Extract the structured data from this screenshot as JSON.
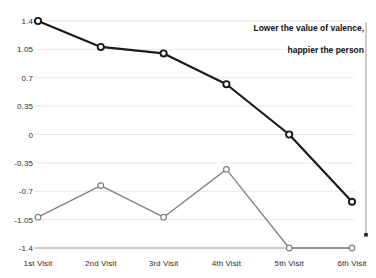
{
  "chart_data": {
    "type": "line",
    "title": "",
    "subtitle": "",
    "xlabel": "",
    "ylabel": "",
    "categories": [
      "1st Visit",
      "2nd Visit",
      "3rd Visit",
      "4th Visit",
      "5th Visit",
      "6th Visit"
    ],
    "ylim": [
      -1.4,
      1.4
    ],
    "yticks": [
      "1.4",
      "1.05",
      "0.7",
      "0.35",
      "0",
      "-0.35",
      "-0.7",
      "-1.05",
      "-1.4"
    ],
    "ytick_values": [
      1.4,
      1.05,
      0.7,
      0.35,
      0,
      -0.35,
      -0.7,
      -1.05,
      -1.4
    ],
    "grid": true,
    "legend": "none",
    "series": [
      {
        "name": "upper-series",
        "color": "#1a1a1a",
        "marker": "open-circle",
        "values": [
          1.4,
          1.08,
          1.0,
          0.62,
          0.0,
          -0.83
        ]
      },
      {
        "name": "lower-series",
        "color": "#808080",
        "marker": "open-circle",
        "values": [
          -1.02,
          -0.63,
          -1.02,
          -0.43,
          -1.4,
          -1.4
        ]
      }
    ],
    "annotations": [
      {
        "name": "valence-note",
        "line1": "Lower the value of valence,",
        "line2": "happier the person",
        "arrow": "down-arrow"
      }
    ]
  },
  "colors": {
    "upper_line": "#1a1a1a",
    "lower_line": "#808080",
    "grid": "#e8e8e8",
    "axis_text": "#2b2b2b",
    "arrow": "#9a9a9a",
    "background": "#ffffff"
  }
}
